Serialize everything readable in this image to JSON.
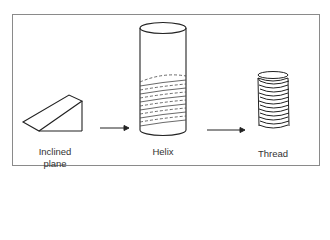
{
  "figure": {
    "stages": [
      {
        "id": "inclined-plane",
        "label_line1": "Inclined",
        "label_line2": "plane"
      },
      {
        "id": "helix",
        "label_line1": "Helix"
      },
      {
        "id": "thread",
        "label_line1": "Thread"
      }
    ],
    "arrows": [
      "inclined-plane-to-helix",
      "helix-to-thread"
    ],
    "colors": {
      "stroke": "#222222",
      "frame": "#8a8a8a",
      "background": "#ffffff"
    }
  }
}
